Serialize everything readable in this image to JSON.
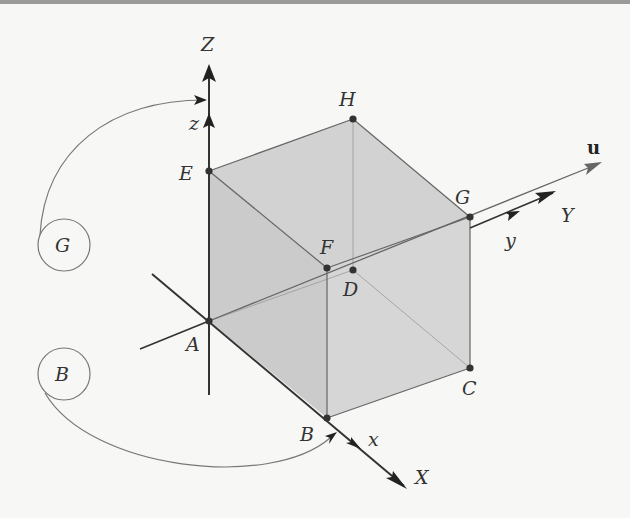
{
  "figure": {
    "type": "3D cube with coordinate axes and rotation vector",
    "colors": {
      "face_fill": "#cfcfcf",
      "edge": "#666666",
      "axis": "#333333",
      "background": "#f7f7f5",
      "vector_u": "#555555"
    }
  },
  "axes": {
    "Z": {
      "label": "Z",
      "sub_label": "z"
    },
    "X": {
      "label": "X",
      "sub_label": "x"
    },
    "Y": {
      "label": "Y",
      "sub_label": "y"
    },
    "vector": {
      "label": "u"
    }
  },
  "vertices": {
    "A": {
      "label": "A",
      "x": 209,
      "y": 321
    },
    "B": {
      "label": "B",
      "x": 327,
      "y": 418
    },
    "C": {
      "label": "C",
      "x": 470,
      "y": 368
    },
    "D": {
      "label": "D",
      "x": 353,
      "y": 270
    },
    "E": {
      "label": "E",
      "x": 209,
      "y": 171
    },
    "F": {
      "label": "F",
      "x": 327,
      "y": 268
    },
    "G": {
      "label": "G",
      "x": 470,
      "y": 217
    },
    "H": {
      "label": "H",
      "x": 353,
      "y": 119
    }
  },
  "callouts": [
    {
      "label": "G",
      "target": "z-axis"
    },
    {
      "label": "B",
      "target": "x-axis"
    }
  ]
}
